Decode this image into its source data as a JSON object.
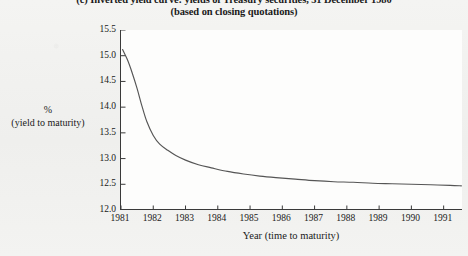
{
  "caption": {
    "line1": "(c) Inverted yield curve: yields of Treasury securities, 31 December 1980",
    "line2": "(based on closing quotations)"
  },
  "axis_label": {
    "percent": "%",
    "sub": "(yield to maturity)"
  },
  "chart_data": {
    "type": "line",
    "title": "(c) Inverted yield curve: yields of Treasury securities, 31 December 1980",
    "subtitle": "(based on closing quotations)",
    "xlabel": "Year (time to maturity)",
    "ylabel": "% (yield to maturity)",
    "xlim": [
      1981,
      1991.6
    ],
    "ylim": [
      12.0,
      15.5
    ],
    "grid": false,
    "legend": null,
    "x_ticks": [
      "1981",
      "1982",
      "1983",
      "1984",
      "1985",
      "1986",
      "1987",
      "1988",
      "1989",
      "1990",
      "1991"
    ],
    "y_ticks": [
      "12.0",
      "12.5",
      "13.0",
      "13.5",
      "14.0",
      "14.5",
      "15.0",
      "15.5"
    ],
    "series": [
      {
        "name": "Yield to maturity",
        "color": "#555555",
        "x": [
          1981.05,
          1981.2,
          1981.35,
          1981.5,
          1981.65,
          1981.8,
          1982.0,
          1982.2,
          1982.45,
          1982.7,
          1983.0,
          1983.4,
          1983.8,
          1984.3,
          1984.8,
          1985.3,
          1985.8,
          1986.4,
          1987.0,
          1987.6,
          1988.2,
          1988.8,
          1989.4,
          1990.0,
          1990.6,
          1991.2,
          1991.55
        ],
        "y": [
          15.12,
          14.92,
          14.66,
          14.36,
          14.02,
          13.72,
          13.45,
          13.28,
          13.16,
          13.06,
          12.97,
          12.88,
          12.82,
          12.75,
          12.7,
          12.66,
          12.63,
          12.6,
          12.57,
          12.55,
          12.54,
          12.52,
          12.51,
          12.5,
          12.49,
          12.48,
          12.47
        ]
      }
    ]
  }
}
